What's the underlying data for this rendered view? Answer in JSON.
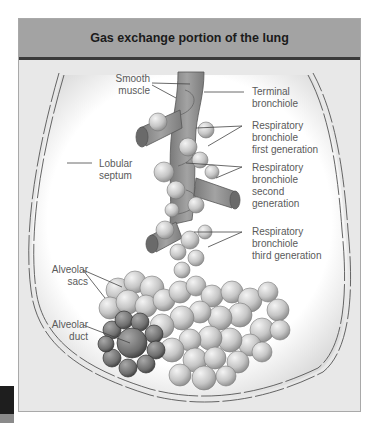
{
  "figure": {
    "title": "Gas exchange portion of the lung",
    "colors": {
      "header_bg": "#a3a3a3",
      "header_rule": "#3a3a3a",
      "panel_bg": "#e8e8e8",
      "lobule_fill": "#ffffff",
      "bronchiole": "#8f8f8f",
      "alveoli": "#c9c9c9",
      "alveolar_duct": "#6e6e6e",
      "label_text": "#5a5a5a"
    },
    "labels": {
      "smooth_muscle": "Smooth muscle",
      "smooth_muscle_l1": "Smooth",
      "smooth_muscle_l2": "muscle",
      "lobular_septum_l1": "Lobular",
      "lobular_septum_l2": "septum",
      "terminal_bronchiole_l1": "Terminal",
      "terminal_bronchiole_l2": "bronchiole",
      "resp_first_l1": "Respiratory",
      "resp_first_l2": "bronchiole",
      "resp_first_l3": "first generation",
      "resp_second_l1": "Respiratory",
      "resp_second_l2": "bronchiole",
      "resp_second_l3": "second",
      "resp_second_l4": "generation",
      "resp_third_l1": "Respiratory",
      "resp_third_l2": "bronchiole",
      "resp_third_l3": "third generation",
      "alveolar_sacs_l1": "Alveolar",
      "alveolar_sacs_l2": "sacs",
      "alveolar_duct_l1": "Alveolar",
      "alveolar_duct_l2": "duct"
    }
  }
}
